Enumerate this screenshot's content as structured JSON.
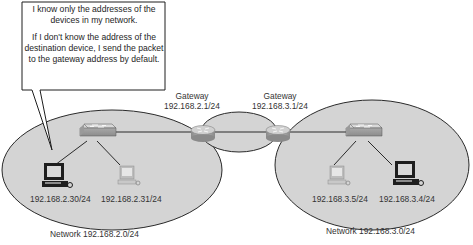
{
  "callout": {
    "line1": "I know only the addresses of the devices in my network.",
    "line2": "If I don't know the address of the destination device, I send the packet to the gateway address by default."
  },
  "gateways": [
    {
      "title": "Gateway",
      "address": "192.168.2.1/24"
    },
    {
      "title": "Gateway",
      "address": "192.168.3.1/24"
    }
  ],
  "networks": [
    {
      "label": "Network 192.168.2.0/24",
      "hosts": [
        {
          "address": "192.168.2.30/24",
          "icon": "desktop-computer-icon",
          "highlighted": true
        },
        {
          "address": "192.168.2.31/24",
          "icon": "desktop-computer-icon",
          "highlighted": false
        }
      ]
    },
    {
      "label": "Network 192.168.3.0/24",
      "hosts": [
        {
          "address": "192.168.3.5/24",
          "icon": "desktop-computer-icon",
          "highlighted": false
        },
        {
          "address": "192.168.3.4/24",
          "icon": "desktop-computer-icon",
          "highlighted": true
        }
      ]
    }
  ],
  "colors": {
    "network_fill": "#d4d4d4",
    "outline": "#2a2a2a",
    "device_gray": "#9a9a9a"
  }
}
